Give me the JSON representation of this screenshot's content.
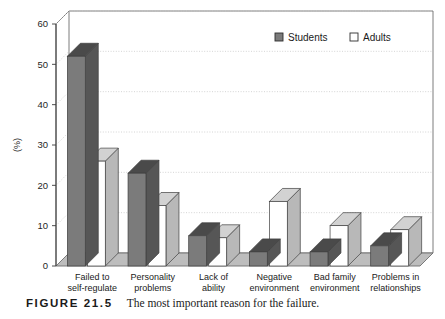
{
  "caption": {
    "figure_number": "FIGURE 21.5",
    "text": "The most important reason for the failure."
  },
  "legend": {
    "position": "top-right",
    "entries": [
      {
        "label": "Students",
        "color": "#7b7b7b"
      },
      {
        "label": "Adults",
        "color": "#ffffff"
      }
    ]
  },
  "axis": {
    "y_title": "(%)",
    "y_ticks": [
      "0",
      "10",
      "20",
      "30",
      "40",
      "50",
      "60"
    ]
  },
  "colors": {
    "students_front": "#7b7b7b",
    "students_side": "#565656",
    "students_top": "#4a4a4a",
    "adults_front": "#ffffff",
    "adults_side": "#b8b8b8",
    "adults_top": "#d2d2d2",
    "floor": "#bdbdbd",
    "frame": "#6e6e6e",
    "gridline": "#c9c9c9"
  },
  "chart_data": {
    "type": "bar",
    "title": "The most important reason for the failure.",
    "xlabel": "",
    "ylabel": "(%)",
    "ylim": [
      0,
      60
    ],
    "grid": true,
    "legend_position": "top-right",
    "categories": [
      "Failed to self-regulate",
      "Personality problems",
      "Lack of ability",
      "Negative environment",
      "Bad family environment",
      "Problems in relationships"
    ],
    "category_lines": [
      [
        "Failed to",
        "self-regulate"
      ],
      [
        "Personality",
        "problems"
      ],
      [
        "Lack of",
        "ability"
      ],
      [
        "Negative",
        "environment"
      ],
      [
        "Bad family",
        "environment"
      ],
      [
        "Problems in",
        "relationships"
      ]
    ],
    "series": [
      {
        "name": "Students",
        "values": [
          52,
          23,
          7.5,
          3.5,
          3.5,
          5
        ]
      },
      {
        "name": "Adults",
        "values": [
          26,
          15,
          7,
          16,
          10,
          9
        ]
      }
    ]
  }
}
